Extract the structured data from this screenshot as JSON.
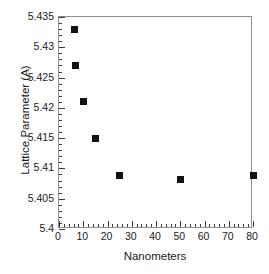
{
  "chart_data": {
    "type": "scatter",
    "title": "",
    "xlabel": "Nanometers",
    "ylabel": "Lattice Parameter (A)",
    "xlim": [
      0,
      80
    ],
    "ylim": [
      5.4,
      5.435
    ],
    "grid": false,
    "legend": null,
    "marker": "filled-square",
    "marker_color": "#121212",
    "frame_color": "#8d8d8d",
    "xticks": [
      0,
      10,
      20,
      30,
      40,
      50,
      60,
      70,
      80
    ],
    "xtick_labels": [
      "0",
      "10",
      "20",
      "30",
      "40",
      "50",
      "60",
      "70",
      "80"
    ],
    "x_minor_tick_interval": 2,
    "yticks": [
      5.4,
      5.405,
      5.41,
      5.415,
      5.42,
      5.425,
      5.43,
      5.435
    ],
    "ytick_labels": [
      "5.4",
      "5.405",
      "5.41",
      "5.415",
      "5.42",
      "5.425",
      "5.43",
      "5.435"
    ],
    "y_minor_tick_interval": 0.001,
    "points": [
      {
        "x": 6.5,
        "y": 5.433
      },
      {
        "x": 7.0,
        "y": 5.427
      },
      {
        "x": 10.0,
        "y": 5.4211
      },
      {
        "x": 15.0,
        "y": 5.415
      },
      {
        "x": 25.0,
        "y": 5.4088
      },
      {
        "x": 50.0,
        "y": 5.4081
      },
      {
        "x": 80.0,
        "y": 5.4088
      }
    ]
  }
}
